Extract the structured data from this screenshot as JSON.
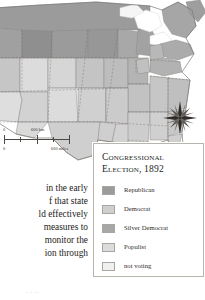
{
  "figure": {
    "kind": "thematic-map",
    "region": "United States"
  },
  "legend": {
    "title_line1": "Congressional",
    "title_line2": "Election, 1892",
    "items": [
      {
        "label": "Republican",
        "color": "#9b9b9b"
      },
      {
        "label": "Democrat",
        "color": "#cfcfcf"
      },
      {
        "label": "Silver Democrat",
        "color": "#a8a8a8"
      },
      {
        "label": "Populist",
        "color": "#dcdcdc"
      },
      {
        "label": "not voting",
        "color": "#f0f0f0"
      }
    ]
  },
  "scalebar": {
    "km_zero": "0",
    "km_max": "600 km",
    "mi_zero": "0",
    "mi_max": "600 miles"
  },
  "compass": {
    "name": "compass-rose"
  },
  "body_text": {
    "lines": [
      "in the early",
      "f that state",
      "ld effectively",
      "measures to",
      "monitor the",
      "ion through"
    ]
  },
  "bottom_caption": {
    "text": "·  ·   ··"
  },
  "map_colors": {
    "republican": "#9b9b9b",
    "democrat": "#cfcfcf",
    "silver_democrat": "#a8a8a8",
    "populist": "#dcdcdc",
    "not_voting": "#f0f0f0",
    "border": "#8d8a86",
    "water": "#ffffff"
  }
}
